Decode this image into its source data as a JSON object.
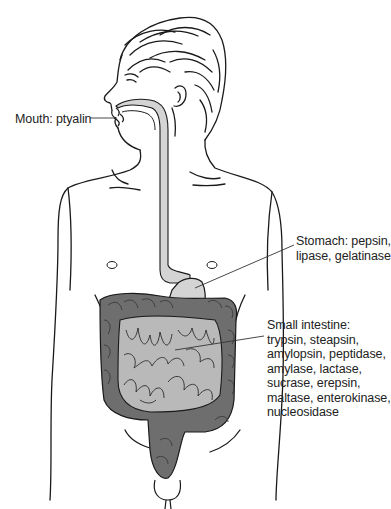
{
  "diagram": {
    "colors": {
      "outline": "#1a1a1a",
      "digestive_tract_light": "#d4d4d4",
      "small_intestine": "#b9b9b9",
      "large_intestine": "#6e6e6e",
      "label_text": "#222222",
      "leader_line": "#333333",
      "background": "#ffffff"
    },
    "labels": [
      {
        "id": "mouth",
        "lines": [
          "Mouth: ptyalin"
        ]
      },
      {
        "id": "stomach",
        "lines": [
          "Stomach: pepsin,",
          "lipase, gelatinase"
        ]
      },
      {
        "id": "small-intestine",
        "lines": [
          "Small intestine:",
          "trypsin, steapsin,",
          "amylopsin, peptidase,",
          "amylase, lactase,",
          "sucrase, erepsin,",
          "maltase, enterokinase,",
          "nucleosidase"
        ]
      }
    ]
  }
}
